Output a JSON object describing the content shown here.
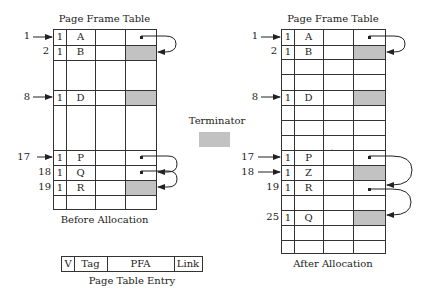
{
  "before": {
    "title": "Page Frame Table",
    "caption": "Before Allocation",
    "entries": [
      {
        "index": "1",
        "pointer": true,
        "v": "1",
        "tag": "A",
        "link": "dot"
      },
      {
        "index": "2",
        "pointer": false,
        "v": "1",
        "tag": "B",
        "link": "shaded"
      },
      {
        "index": "8",
        "pointer": true,
        "v": "1",
        "tag": "D",
        "link": "shaded"
      },
      {
        "index": "17",
        "pointer": true,
        "v": "1",
        "tag": "P",
        "link": "dot"
      },
      {
        "index": "18",
        "pointer": false,
        "v": "1",
        "tag": "Q",
        "link": "dot"
      },
      {
        "index": "19",
        "pointer": false,
        "v": "1",
        "tag": "R",
        "link": "shaded"
      }
    ]
  },
  "terminator": {
    "label": "Terminator",
    "color": "#c2c2c2"
  },
  "after": {
    "title": "Page Frame Table",
    "caption": "After Allocation",
    "entries": [
      {
        "index": "1",
        "pointer": true,
        "v": "1",
        "tag": "A",
        "link": "dot"
      },
      {
        "index": "2",
        "pointer": false,
        "v": "1",
        "tag": "B",
        "link": "shaded"
      },
      {
        "index": "8",
        "pointer": true,
        "v": "1",
        "tag": "D",
        "link": "shaded"
      },
      {
        "index": "17",
        "pointer": true,
        "v": "1",
        "tag": "P",
        "link": "dot"
      },
      {
        "index": "18",
        "pointer": true,
        "v": "1",
        "tag": "Z",
        "link": "shaded"
      },
      {
        "index": "19",
        "pointer": false,
        "v": "1",
        "tag": "R",
        "link": "dot"
      },
      {
        "index": "25",
        "pointer": false,
        "v": "1",
        "tag": "Q",
        "link": "shaded"
      }
    ]
  },
  "entry_format": {
    "caption": "Page Table Entry",
    "fields": [
      "V",
      "Tag",
      "PFA",
      "Link"
    ]
  },
  "colors": {
    "shade": "#c2c2c2",
    "line": "#333333"
  }
}
